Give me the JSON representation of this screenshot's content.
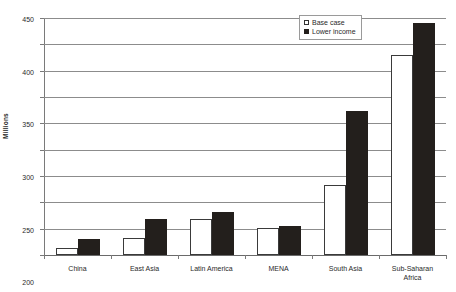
{
  "chart_data": {
    "type": "bar",
    "title": "",
    "xlabel": "",
    "ylabel": "Millions",
    "ylim": [
      0,
      450
    ],
    "ytick_step": 50,
    "yticks": [
      "450",
      "400",
      "350",
      "300",
      "250",
      "200",
      "150",
      "100",
      "50",
      "0"
    ],
    "grid": true,
    "legend_position": "top-right",
    "categories": [
      "China",
      "East Asia",
      "Latin America",
      "MENA",
      "South Asia",
      "Sub-Saharan Africa"
    ],
    "category_label_lines": [
      [
        "China"
      ],
      [
        "East Asia"
      ],
      [
        "Latin America"
      ],
      [
        "MENA"
      ],
      [
        "South Asia"
      ],
      [
        "Sub-Saharan",
        "Africa"
      ]
    ],
    "series": [
      {
        "name": "Base case",
        "color": "#ffffff",
        "edge_color": "#3a3a3a",
        "values": [
          14,
          32,
          68,
          51,
          133,
          380
        ]
      },
      {
        "name": "Lower income",
        "color": "#231f1c",
        "edge_color": "#231f1c",
        "values": [
          30,
          68,
          82,
          56,
          274,
          440
        ]
      }
    ]
  },
  "legend": {
    "items": [
      {
        "label": "Base case",
        "swatch": "hollow-square"
      },
      {
        "label": "Lower income",
        "swatch": "filled-square"
      }
    ]
  },
  "axis": {
    "y_title": "Millions"
  },
  "colors": {
    "base_case_fill": "#ffffff",
    "base_case_edge": "#3a3a3a",
    "lower_income_fill": "#231f1c",
    "gridline": "#8c8c8c",
    "axis": "#7a7a7a",
    "text": "#2a2a2a",
    "background": "#ffffff"
  }
}
